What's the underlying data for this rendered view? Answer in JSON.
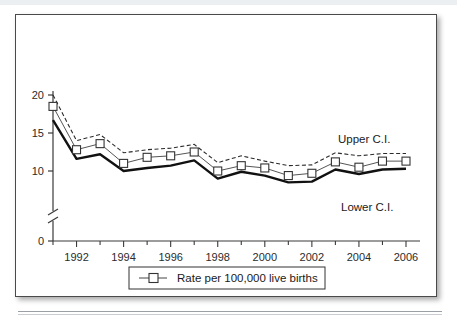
{
  "figure": {
    "legend_label": "Rate per 100,000 live births",
    "upper_annotation": "Upper C.I.",
    "lower_annotation": "Lower C.I."
  },
  "chart_data": {
    "type": "line",
    "title": "",
    "xlabel": "",
    "ylabel": "",
    "grid": false,
    "legend_position": "bottom-center",
    "axis_break": true,
    "axis_break_between": [
      0,
      10
    ],
    "xlim": [
      1991,
      2006
    ],
    "ylim": [
      0,
      20
    ],
    "ytick_labels": [
      "0",
      "10",
      "15",
      "20"
    ],
    "ytick_values": [
      0,
      10,
      15,
      20
    ],
    "xtick_labels": [
      "1992",
      "1994",
      "1996",
      "1998",
      "2000",
      "2002",
      "2004",
      "2006"
    ],
    "xtick_values": [
      1992,
      1994,
      1996,
      1998,
      2000,
      2002,
      2004,
      2006
    ],
    "x": [
      1991,
      1992,
      1993,
      1994,
      1995,
      1996,
      1997,
      1998,
      1999,
      2000,
      2001,
      2002,
      2003,
      2004,
      2005,
      2006
    ],
    "series": [
      {
        "name": "Upper C.I.",
        "style": "dashed",
        "values": [
          20.0,
          14.0,
          14.8,
          12.4,
          12.8,
          13.0,
          13.5,
          11.1,
          12.0,
          11.3,
          10.7,
          10.8,
          12.4,
          12.0,
          12.3,
          12.3
        ]
      },
      {
        "name": "Rate per 100,000 live births",
        "style": "solid-markers",
        "values": [
          18.5,
          12.8,
          13.6,
          11.0,
          11.8,
          12.0,
          12.5,
          10.0,
          10.7,
          10.4,
          9.4,
          9.7,
          11.2,
          10.5,
          11.3,
          11.3
        ]
      },
      {
        "name": "Lower C.I.",
        "style": "solid-thick",
        "values": [
          16.7,
          11.6,
          12.2,
          10.0,
          10.4,
          10.7,
          11.4,
          9.0,
          9.9,
          9.4,
          8.5,
          8.6,
          10.2,
          9.6,
          10.2,
          10.3
        ]
      }
    ]
  }
}
